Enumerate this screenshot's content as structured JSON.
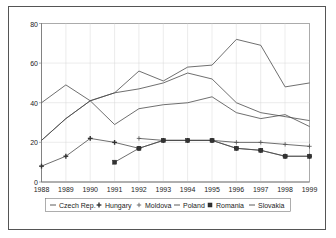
{
  "chart_data": {
    "type": "line",
    "title": "",
    "xlabel": "",
    "ylabel": "",
    "ylim": [
      0,
      80
    ],
    "yticks": [
      0,
      20,
      40,
      60,
      80
    ],
    "grid": true,
    "legend_position": "bottom",
    "x": [
      1988,
      1989,
      1990,
      1991,
      1992,
      1993,
      1994,
      1995,
      1996,
      1997,
      1998,
      1999
    ],
    "categories": [
      "1988",
      "1989",
      "1990",
      "1991",
      "1992",
      "1993",
      "1994",
      "1995",
      "1996",
      "1997",
      "1998",
      "1999"
    ],
    "series": [
      {
        "name": "Czech Rep.",
        "marker": "dash",
        "values": [
          40,
          49,
          41,
          29,
          37,
          39,
          40,
          43,
          35,
          32,
          34,
          28
        ]
      },
      {
        "name": "Hungary",
        "marker": "plus-bold",
        "values": [
          8,
          13,
          22,
          20,
          17,
          21,
          21,
          21,
          17,
          16,
          13,
          13
        ]
      },
      {
        "name": "Moldova",
        "marker": "plus",
        "values": [
          null,
          null,
          null,
          null,
          22,
          21,
          21,
          21,
          20,
          20,
          19,
          18
        ]
      },
      {
        "name": "Poland",
        "marker": "dash",
        "values": [
          21,
          32,
          41,
          45,
          47,
          50,
          55,
          52,
          40,
          35,
          33,
          31
        ]
      },
      {
        "name": "Romania",
        "marker": "square",
        "values": [
          null,
          null,
          null,
          10,
          17,
          21,
          21,
          21,
          17,
          16,
          13,
          13
        ]
      },
      {
        "name": "Slovakia",
        "marker": "dash",
        "values": [
          21,
          32,
          41,
          45,
          56,
          51,
          58,
          59,
          72,
          69,
          48,
          50
        ]
      }
    ]
  },
  "legend": {
    "items": [
      {
        "label": "Czech Rep.",
        "symbol": "dash"
      },
      {
        "label": "Hungary",
        "symbol": "plus-bold"
      },
      {
        "label": "Moldova",
        "symbol": "plus"
      },
      {
        "label": "Poland",
        "symbol": "dash"
      },
      {
        "label": "Romania",
        "symbol": "square"
      },
      {
        "label": "Slovakia",
        "symbol": "dash"
      }
    ]
  },
  "colors": {
    "line": "#4a4a4a",
    "axis": "#888888",
    "grid": "#d8d8d8",
    "frame": "#555555",
    "text": "#222222",
    "background": "#ffffff"
  }
}
